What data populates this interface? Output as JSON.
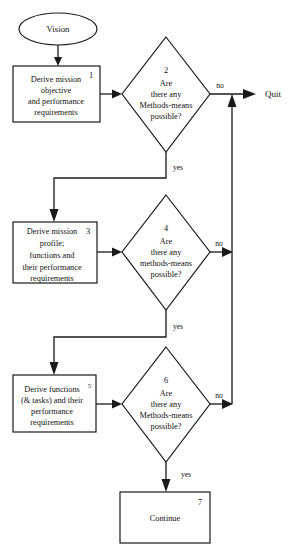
{
  "diagram": {
    "stroke_color": "#1a1a1a",
    "background_color": "#ffffff",
    "nodes": {
      "start": {
        "shape": "ellipse",
        "label": "Vision"
      },
      "process_1": {
        "shape": "rectangle",
        "number": "1",
        "lines": [
          "Derive mission",
          "objective",
          "and performance",
          "requirements"
        ]
      },
      "decision_2": {
        "shape": "diamond",
        "number": "2",
        "lines": [
          "Are",
          "there any",
          "Methods-means",
          "possible?"
        ]
      },
      "process_3": {
        "shape": "rectangle",
        "number": "3",
        "lines": [
          "Derive mission",
          "profile;",
          "functions and",
          "their performance",
          "requirements"
        ]
      },
      "decision_4": {
        "shape": "diamond",
        "number": "4",
        "lines": [
          "Are",
          "there any",
          "methods-means",
          "possible?"
        ]
      },
      "process_5": {
        "shape": "rectangle",
        "number": "5",
        "lines": [
          "Derive functions",
          "(& tasks) and their",
          "performance",
          "requirements"
        ],
        "superscript": "5"
      },
      "decision_6": {
        "shape": "diamond",
        "number": "6",
        "lines": [
          "Are",
          "there any",
          "Methods-means",
          "possible?"
        ]
      },
      "process_7": {
        "shape": "rectangle",
        "number": "7",
        "lines": [
          "Continue"
        ]
      },
      "terminal_quit": {
        "shape": "label",
        "label": "Quit"
      }
    },
    "edge_labels": {
      "no_2": "no",
      "yes_2": "yes",
      "no_4": "no",
      "yes_4": "yes",
      "no_6": "no",
      "yes_6": "yes"
    }
  }
}
